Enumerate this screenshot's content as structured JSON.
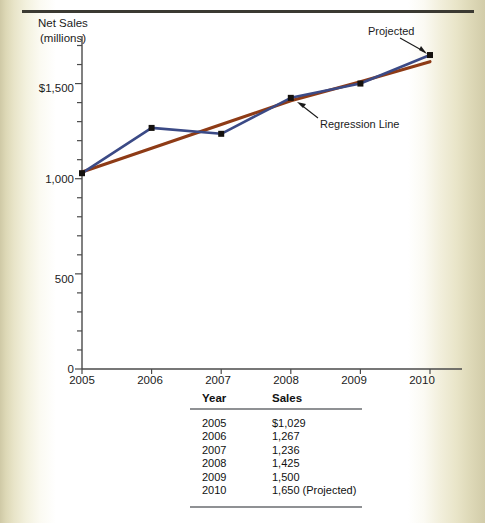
{
  "figure": {
    "top_rule": true,
    "axis_title_line1": "Net Sales",
    "axis_title_line2": "(millions)"
  },
  "annotations": {
    "projected": "Projected",
    "regression": "Regression Line"
  },
  "table": {
    "headers": [
      "Year",
      "Sales"
    ],
    "rows": [
      {
        "year": "2005",
        "sales": "$1,029"
      },
      {
        "year": "2006",
        "sales": "1,267"
      },
      {
        "year": "2007",
        "sales": "1,236"
      },
      {
        "year": "2008",
        "sales": "1,425"
      },
      {
        "year": "2009",
        "sales": "1,500"
      },
      {
        "year": "2010",
        "sales": "1,650 (Projected)"
      }
    ]
  },
  "colors": {
    "data_line": "#3b4a86",
    "regression_line": "#8e3b16",
    "marker": "#14110e",
    "axis": "#4a4a4a",
    "table_rule": "#8f9194",
    "top_rule": "#3b3a32"
  },
  "chart_data": {
    "type": "line",
    "title": "",
    "xlabel": "",
    "ylabel": "Net Sales (millions)",
    "categories": [
      "2005",
      "2006",
      "2007",
      "2008",
      "2009",
      "2010"
    ],
    "ylim": [
      0,
      1750
    ],
    "yticks_major": [
      "0",
      "500",
      "1,000",
      "$1,500"
    ],
    "yticks_major_values": [
      0,
      500,
      1000,
      1500
    ],
    "ytick_minor_step": 100,
    "grid": false,
    "legend": "none",
    "series": [
      {
        "name": "Net Sales",
        "color": "#3b4a86",
        "markers": true,
        "values": [
          1029,
          1267,
          1236,
          1425,
          1500,
          1650
        ]
      },
      {
        "name": "Regression Line",
        "color": "#8e3b16",
        "markers": false,
        "values": [
          1035,
          1160,
          1285,
          1410,
          1510,
          1615
        ]
      }
    ],
    "annotations": [
      {
        "text": "Projected",
        "points_to": {
          "x": "2010",
          "y": 1650
        }
      },
      {
        "text": "Regression Line",
        "points_to": {
          "x": "2007.6",
          "y": 1290
        }
      }
    ]
  }
}
